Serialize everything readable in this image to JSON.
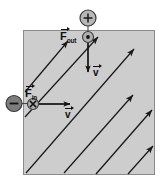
{
  "figure": {
    "field_region": {
      "name": "magnetic-field-region",
      "fill_color": "#cdcdcd",
      "border_color": "#8a8a8a",
      "x": 23,
      "y": 30,
      "width": 132,
      "height": 145
    },
    "field_arrows": {
      "name": "magnetic-field-arrows",
      "count": 6,
      "direction_label": "up-right 45 degrees",
      "color": "#1a1a1a",
      "lines": [
        {
          "x1": 25,
          "y1": 92,
          "x2": 68,
          "y2": 41
        },
        {
          "x1": 25,
          "y1": 117,
          "x2": 98,
          "y2": 37
        },
        {
          "x1": 26,
          "y1": 173,
          "x2": 134,
          "y2": 49
        },
        {
          "x1": 64,
          "y1": 173,
          "x2": 133,
          "y2": 95
        },
        {
          "x1": 96,
          "y1": 174,
          "x2": 152,
          "y2": 110
        },
        {
          "x1": 128,
          "y1": 174,
          "x2": 153,
          "y2": 146
        }
      ]
    },
    "charges": [
      {
        "name": "positive-charge",
        "symbol": "+",
        "cx": 88,
        "cy": 18,
        "r": 8,
        "fill_color": "#b7b7b7",
        "stroke_color": "#3a3a3a"
      },
      {
        "name": "negative-charge",
        "symbol": "−",
        "cx": 14,
        "cy": 103,
        "r": 8,
        "fill_color": "#7d7d7d",
        "stroke_color": "#3a3a3a"
      }
    ],
    "force_markers": [
      {
        "name": "force-out-of-page-marker",
        "symbol": "dot",
        "meaning": "out of page",
        "cx": 88,
        "cy": 37,
        "r": 5.5,
        "fill_color": "#b0b0b0",
        "stroke_color": "#3a3a3a"
      },
      {
        "name": "force-into-page-marker",
        "symbol": "x",
        "meaning": "into page",
        "cx": 33,
        "cy": 104,
        "r": 5.5,
        "fill_color": "#b0b0b0",
        "stroke_color": "#3a3a3a"
      }
    ],
    "labels": {
      "force_out": {
        "name": "force-out-label",
        "base": "F",
        "subscript": "out",
        "full_text": "F⃗out"
      },
      "force_in": {
        "name": "force-in-label",
        "base": "F",
        "subscript": "in",
        "full_text": "F⃗in"
      },
      "velocity_top": {
        "name": "velocity-top-label",
        "base": "v",
        "full_text": "v⃗"
      },
      "velocity_left": {
        "name": "velocity-left-label",
        "base": "v",
        "full_text": "v⃗"
      }
    },
    "vectors": [
      {
        "name": "velocity-vector-top",
        "label": "v",
        "direction": "down",
        "x1": 88,
        "y1": 42,
        "x2": 88,
        "y2": 76
      },
      {
        "name": "velocity-vector-left",
        "label": "v",
        "direction": "right",
        "x1": 39,
        "y1": 104,
        "x2": 74,
        "y2": 104
      },
      {
        "name": "charge-connector-positive",
        "direction": "down",
        "x1": 88,
        "y1": 26,
        "x2": 88,
        "y2": 32
      },
      {
        "name": "charge-connector-negative",
        "direction": "right",
        "x1": 22,
        "y1": 104,
        "x2": 28,
        "y2": 104
      }
    ]
  }
}
